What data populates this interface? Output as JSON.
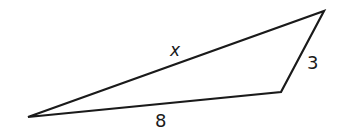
{
  "diagram": {
    "type": "triangle",
    "vertices": {
      "left": [
        28,
        117
      ],
      "bottom_right": [
        281,
        92
      ],
      "top_right": [
        324,
        11
      ]
    },
    "sides": [
      {
        "id": "long_side",
        "label": "x",
        "from": "left",
        "to": "top_right"
      },
      {
        "id": "short_side",
        "label": "3",
        "from": "bottom_right",
        "to": "top_right"
      },
      {
        "id": "base",
        "label": "8",
        "from": "left",
        "to": "bottom_right"
      }
    ],
    "stroke_color": "#1a1a1a"
  }
}
